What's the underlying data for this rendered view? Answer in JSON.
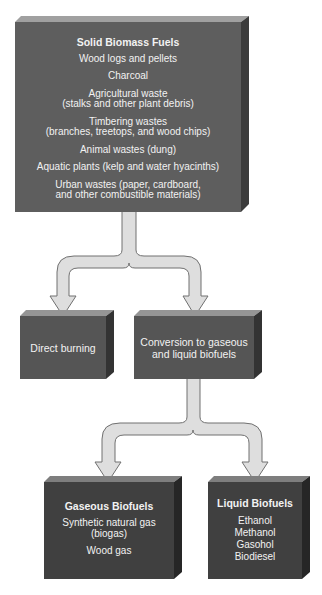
{
  "diagram": {
    "colors": {
      "top_box_front": "#5e5e5e",
      "top_box_top": "#a0a0a0",
      "top_box_side": "#3c3c3c",
      "mid_box_front": "#555555",
      "mid_box_top": "#959595",
      "mid_box_side": "#333333",
      "bottom_box_front": "#404040",
      "bottom_box_top": "#7e7e7e",
      "bottom_box_side": "#262626",
      "arrow_fill": "#dedede",
      "arrow_stroke": "#707070",
      "text": "#f2f2f2"
    },
    "solid_biomass": {
      "title": "Solid Biomass Fuels",
      "items": [
        "Wood logs and pellets",
        "Charcoal",
        "Agricultural waste\n(stalks and other plant debris)",
        "Timbering wastes\n(branches, treetops, and wood chips)",
        "Animal wastes (dung)",
        "Aquatic plants (kelp and water hyacinths)",
        "Urban wastes (paper, cardboard,\nand other combustible materials)"
      ]
    },
    "direct_burning": {
      "label": "Direct burning"
    },
    "conversion": {
      "label": "Conversion to gaseous\nand liquid biofuels"
    },
    "gaseous_biofuels": {
      "title": "Gaseous Biofuels",
      "items": [
        "Synthetic natural gas\n(biogas)",
        "Wood gas"
      ]
    },
    "liquid_biofuels": {
      "title": "Liquid Biofuels",
      "items": [
        "Ethanol",
        "Methanol",
        "Gasohol",
        "Biodiesel"
      ]
    }
  }
}
